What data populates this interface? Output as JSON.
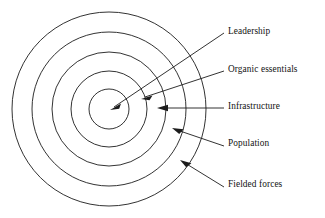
{
  "diagram": {
    "type": "concentric-rings",
    "title": "",
    "background_color": "#ffffff",
    "stroke_color": "#1c1c1c",
    "text_color": "#121212",
    "center": {
      "x": 109,
      "y": 109
    },
    "rings": [
      {
        "index": 1,
        "label": "Leadership",
        "position": "innermost",
        "radius": 20,
        "label_x": 228,
        "label_y": 33,
        "arrow_tip": {
          "x": 111,
          "y": 110
        },
        "arrow_tail": {
          "x": 224,
          "y": 33
        }
      },
      {
        "index": 2,
        "label": "Organic essentials",
        "position": "second",
        "radius": 38,
        "label_x": 228,
        "label_y": 71,
        "arrow_tip": {
          "x": 142,
          "y": 99
        },
        "arrow_tail": {
          "x": 224,
          "y": 71
        }
      },
      {
        "index": 3,
        "label": "Infrastructure",
        "position": "middle",
        "radius": 57,
        "label_x": 228,
        "label_y": 107,
        "arrow_tip": {
          "x": 158,
          "y": 108
        },
        "arrow_tail": {
          "x": 224,
          "y": 108
        }
      },
      {
        "index": 4,
        "label": "Population",
        "position": "fourth",
        "radius": 77,
        "label_x": 228,
        "label_y": 144,
        "arrow_tip": {
          "x": 173,
          "y": 128
        },
        "arrow_tail": {
          "x": 224,
          "y": 146
        }
      },
      {
        "index": 5,
        "label": "Fielded forces",
        "position": "outermost",
        "radius": 97,
        "label_x": 228,
        "label_y": 185,
        "arrow_tip": {
          "x": 181,
          "y": 160
        },
        "arrow_tail": {
          "x": 224,
          "y": 187
        }
      }
    ]
  }
}
